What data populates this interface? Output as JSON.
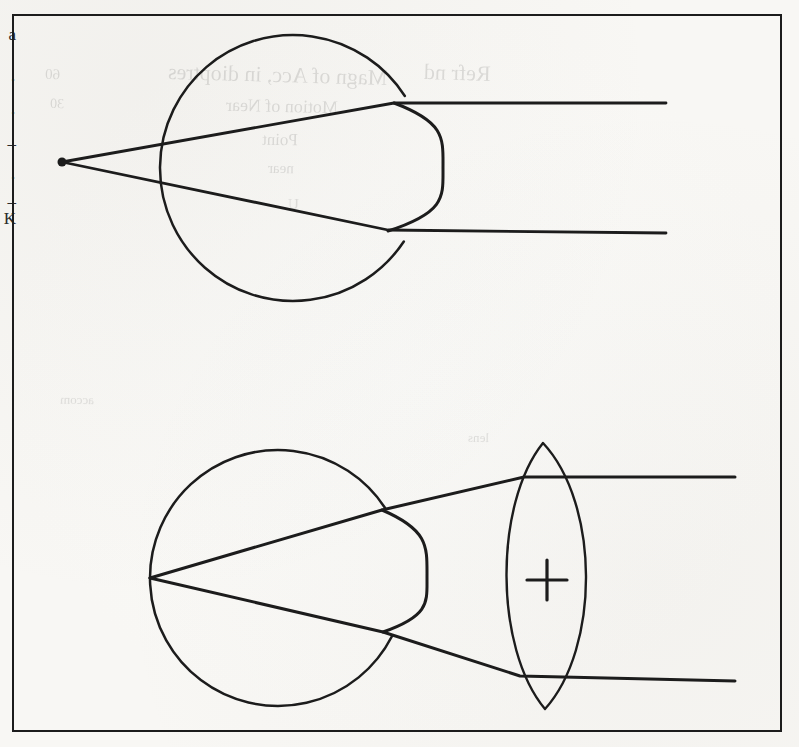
{
  "document": {
    "kind": "scanned-textbook-figure",
    "page_background": "#fdfdfc",
    "ink_color": "#1c1c1c",
    "frame": {
      "x": 12,
      "y": 14,
      "width": 770,
      "height": 718,
      "border_width": 2.4,
      "border_color": "#1c1c1c"
    }
  },
  "margin_glyphs": {
    "label": "cut-off text at left page edge",
    "items": [
      {
        "char": "a",
        "top": 26
      },
      {
        "char": "·",
        "top": 72
      },
      {
        "char": "·",
        "top": 105
      },
      {
        "char": "–",
        "top": 135
      },
      {
        "char": "·",
        "top": 170
      },
      {
        "char": "–",
        "top": 193
      },
      {
        "char": "K",
        "top": 210
      }
    ]
  },
  "ghost_text": {
    "label": "faint show-through from reverse side of page",
    "opacity": 0.115,
    "lines": [
      {
        "text": "Magn of Acc, in dioptres",
        "left": 168,
        "top": 62,
        "size": 22,
        "rotate": -1.6,
        "scaleX": -1
      },
      {
        "text": "Refr   nd",
        "left": 424,
        "top": 60,
        "size": 22,
        "rotate": -1.6,
        "scaleX": -1
      },
      {
        "text": "Motion   of   Near",
        "left": 226,
        "top": 96,
        "size": 18,
        "rotate": -1.2,
        "scaleX": -1
      },
      {
        "text": "Point",
        "left": 262,
        "top": 130,
        "size": 17,
        "rotate": -1.0,
        "scaleX": -1
      },
      {
        "text": "near",
        "left": 268,
        "top": 160,
        "size": 15,
        "rotate": -0.8,
        "scaleX": -1
      },
      {
        "text": "U",
        "left": 288,
        "top": 196,
        "size": 15,
        "rotate": -0.8,
        "scaleX": -1
      },
      {
        "text": "60",
        "left": 45,
        "top": 66,
        "size": 15,
        "rotate": -1.4,
        "scaleX": -1
      },
      {
        "text": "30",
        "left": 50,
        "top": 96,
        "size": 14,
        "rotate": -1.2,
        "scaleX": -1
      },
      {
        "text": "accom",
        "left": 60,
        "top": 392,
        "size": 13,
        "rotate": -0.8,
        "scaleX": -1
      },
      {
        "text": "lens",
        "left": 468,
        "top": 430,
        "size": 13,
        "rotate": -0.8,
        "scaleX": -1
      }
    ]
  },
  "chart_data": {
    "type": "diagram",
    "panels": [
      {
        "id": "panel-top",
        "caption": "Uncorrected eye — rays diverge from a point in front of the eye and leave the cornea parallel",
        "eyeball": {
          "shape": "circle",
          "center_x": 293,
          "center_y": 168,
          "radius": 133,
          "stroke_width": 2.5
        },
        "cornea": {
          "shape": "bulge",
          "side": "right",
          "top_point": {
            "x": 394,
            "y": 103
          },
          "apex": {
            "x": 443,
            "y": 168
          },
          "bottom_point": {
            "x": 388,
            "y": 231
          },
          "stroke_width": 3.0
        },
        "far_point": {
          "x": 62,
          "y": 162,
          "radius": 4.5,
          "filled": true,
          "label": "far point marker dot"
        },
        "rays": [
          {
            "name": "upper-ray",
            "points": [
              {
                "x": 62,
                "y": 162
              },
              {
                "x": 394,
                "y": 103
              },
              {
                "x": 666,
                "y": 103
              }
            ]
          },
          {
            "name": "lower-ray",
            "points": [
              {
                "x": 62,
                "y": 162
              },
              {
                "x": 388,
                "y": 230
              },
              {
                "x": 666,
                "y": 233
              }
            ]
          }
        ]
      },
      {
        "id": "panel-bottom",
        "caption": "Corrected eye — a biconvex (plus) lens converges incoming parallel rays onto the retina",
        "eyeball": {
          "shape": "circle",
          "center_x": 278,
          "center_y": 578,
          "radius": 128,
          "stroke_width": 2.5
        },
        "cornea": {
          "shape": "bulge",
          "side": "right",
          "top_point": {
            "x": 382,
            "y": 510
          },
          "apex": {
            "x": 427,
            "y": 578
          },
          "bottom_point": {
            "x": 383,
            "y": 632
          },
          "stroke_width": 3.0
        },
        "retina_point": {
          "x": 150,
          "y": 578,
          "label": "convergence point on retina"
        },
        "lens": {
          "name": "converging-lens",
          "type": "biconvex",
          "sign": "+",
          "top_apex": {
            "x": 543,
            "y": 443
          },
          "bottom_apex": {
            "x": 545,
            "y": 709
          },
          "left_bulge_x": 500,
          "right_bulge_x": 594,
          "sign_center": {
            "x": 547,
            "y": 580
          },
          "sign_arm_length": 20,
          "stroke_width": 2.4
        },
        "rays": [
          {
            "name": "upper-ray",
            "points": [
              {
                "x": 150,
                "y": 578
              },
              {
                "x": 382,
                "y": 510
              },
              {
                "x": 524,
                "y": 477
              },
              {
                "x": 735,
                "y": 477
              }
            ]
          },
          {
            "name": "lower-ray",
            "points": [
              {
                "x": 150,
                "y": 578
              },
              {
                "x": 383,
                "y": 632
              },
              {
                "x": 520,
                "y": 676
              },
              {
                "x": 735,
                "y": 681
              }
            ]
          }
        ]
      }
    ]
  }
}
